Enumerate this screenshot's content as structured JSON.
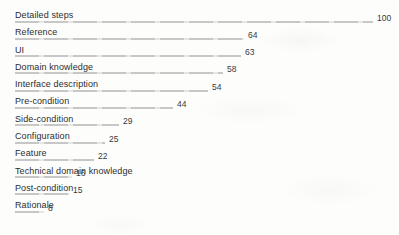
{
  "page": {
    "background": "#fdfdfc"
  },
  "chart_data": {
    "type": "bar",
    "orientation": "horizontal",
    "title": "",
    "xlabel": "",
    "ylabel": "",
    "xlim": [
      0,
      100
    ],
    "grid": false,
    "legend": false,
    "bar_color": "#c8c8c8",
    "label_color": "#2d2d2d",
    "value_label_color": "#3a3a3a",
    "value_labels_visible": true,
    "categories": [
      "Detailed steps",
      "Reference",
      "UI",
      "Domain knowledge",
      "Interface description",
      "Pre-condition",
      "Side-condition",
      "Configuration",
      "Feature",
      "Technical domain knowledge",
      "Post-condition",
      "Rationale"
    ],
    "values": [
      100,
      64,
      63,
      58,
      54,
      44,
      29,
      25,
      22,
      16,
      15,
      8
    ]
  }
}
